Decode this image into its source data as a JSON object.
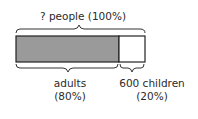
{
  "diagram": {
    "type": "bar-model",
    "total_label": "? people (100%)",
    "segments": [
      {
        "name": "adults",
        "label_line1": "adults",
        "label_line2": "(80%)",
        "percent": 80,
        "fill": "#9a9a9a"
      },
      {
        "name": "children",
        "label_line1": "600 children",
        "label_line2": "(20%)",
        "percent": 20,
        "fill": "#ffffff"
      }
    ]
  }
}
